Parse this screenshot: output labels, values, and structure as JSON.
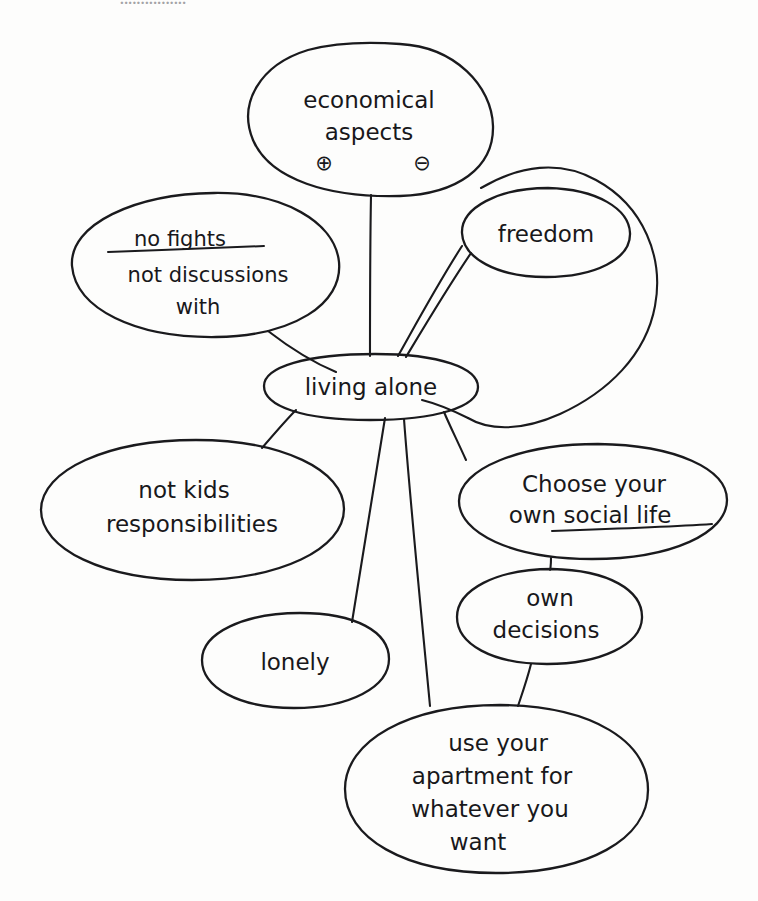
{
  "document": {
    "kind": "hand-drawn mind map",
    "background_color": "#fdfdfc",
    "ink_color": "#1a1a1d",
    "top_clipped_text_artifact": "................"
  },
  "diagram": {
    "central_node": {
      "id": "living-alone",
      "label": "living alone",
      "cx": 371,
      "cy": 386,
      "rx": 107,
      "ry": 32
    },
    "nodes": [
      {
        "id": "economical-aspects",
        "label_lines": [
          "economical",
          "aspects"
        ],
        "annotations": [
          "⊕",
          "⊖"
        ],
        "annotation_names": [
          "circled-plus",
          "circled-minus"
        ],
        "cx": 369,
        "cy": 120,
        "rx": 124,
        "ry": 78
      },
      {
        "id": "no-fights",
        "label_lines": [
          "no fights",
          "not discussions",
          "with"
        ],
        "strikethrough_line_index": 0,
        "cx": 205,
        "cy": 264,
        "rx": 134,
        "ry": 72
      },
      {
        "id": "freedom",
        "label_lines": [
          "freedom"
        ],
        "cx": 546,
        "cy": 232,
        "rx": 84,
        "ry": 45
      },
      {
        "id": "not-kids-responsibilities",
        "label_lines": [
          "not kids",
          "responsibilities"
        ],
        "cx": 192,
        "cy": 510,
        "rx": 152,
        "ry": 70
      },
      {
        "id": "choose-your-own-social-life",
        "label_lines": [
          "Choose your",
          "own social life"
        ],
        "underline_segment": "social life",
        "cx": 593,
        "cy": 501,
        "rx": 135,
        "ry": 57
      },
      {
        "id": "own-decisions",
        "label_lines": [
          "own",
          "decisions"
        ],
        "cx": 549,
        "cy": 616,
        "rx": 93,
        "ry": 48
      },
      {
        "id": "lonely",
        "label_lines": [
          "lonely"
        ],
        "cx": 295,
        "cy": 660,
        "rx": 94,
        "ry": 48
      },
      {
        "id": "use-your-apartment",
        "label_lines": [
          "use your",
          "apartment for",
          "whatever you",
          "want"
        ],
        "cx": 496,
        "cy": 789,
        "rx": 152,
        "ry": 85
      }
    ],
    "edges": [
      {
        "from": "economical-aspects",
        "to": "living-alone",
        "style": "straight"
      },
      {
        "from": "no-fights",
        "to": "living-alone",
        "style": "straight"
      },
      {
        "from": "freedom",
        "to": "living-alone",
        "style": "double-curve"
      },
      {
        "from": "freedom",
        "to": "living-alone",
        "style": "long-sweeping-loop"
      },
      {
        "from": "not-kids-responsibilities",
        "to": "living-alone",
        "style": "straight"
      },
      {
        "from": "choose-your-own-social-life",
        "to": "living-alone",
        "style": "straight"
      },
      {
        "from": "choose-your-own-social-life",
        "to": "own-decisions",
        "style": "straight"
      },
      {
        "from": "own-decisions",
        "to": "use-your-apartment",
        "style": "straight"
      },
      {
        "from": "living-alone",
        "to": "lonely",
        "style": "long-straight"
      },
      {
        "from": "living-alone",
        "to": "use-your-apartment",
        "style": "long-straight"
      }
    ]
  }
}
